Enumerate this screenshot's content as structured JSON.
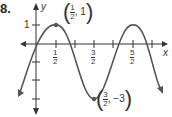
{
  "problem_number": "8.",
  "axes": {
    "x_label": "x",
    "y_label": "y"
  },
  "y_tick_label": "1",
  "x_tick_labels": [
    {
      "num": "1",
      "den": "2"
    },
    {
      "num": "3",
      "den": "2"
    },
    {
      "num": "5",
      "den": "2"
    }
  ],
  "points": [
    {
      "label_num": "1",
      "label_den": "2",
      "label_y": "1",
      "x": 0.5,
      "y": 1
    },
    {
      "label_num": "3",
      "label_den": "2",
      "label_y": "−3",
      "x": 1.5,
      "y": -3
    }
  ],
  "colors": {
    "curve": "#555555",
    "axis": "#333333"
  }
}
